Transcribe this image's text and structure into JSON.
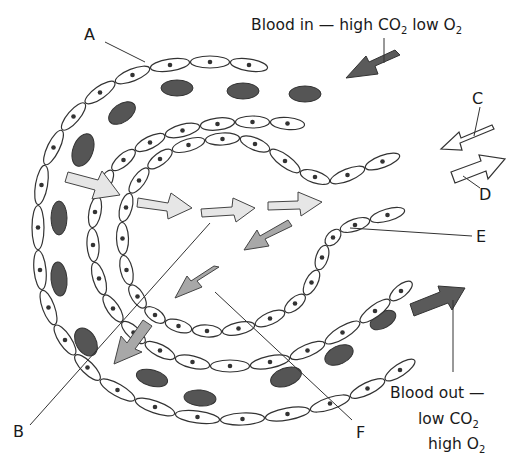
{
  "diagram": {
    "labels": {
      "A": "A",
      "B": "B",
      "C": "C",
      "D": "D",
      "E": "E",
      "F": "F"
    },
    "captions": {
      "blood_in_main": "Blood in — high CO",
      "blood_in_sub1": "2",
      "blood_in_mid": " low O",
      "blood_in_sub2": "2",
      "blood_out_line1": "Blood out —",
      "blood_out_line2_main": "low CO",
      "blood_out_line2_sub": "2",
      "blood_out_line3_main": "high O",
      "blood_out_line3_sub": "2"
    },
    "colors": {
      "red_blood_cell": "#555555",
      "arrow_light": "#e6e6e6",
      "arrow_mid": "#a8a8a8",
      "arrow_dark": "#5a5a5a",
      "outline": "#333333"
    }
  }
}
